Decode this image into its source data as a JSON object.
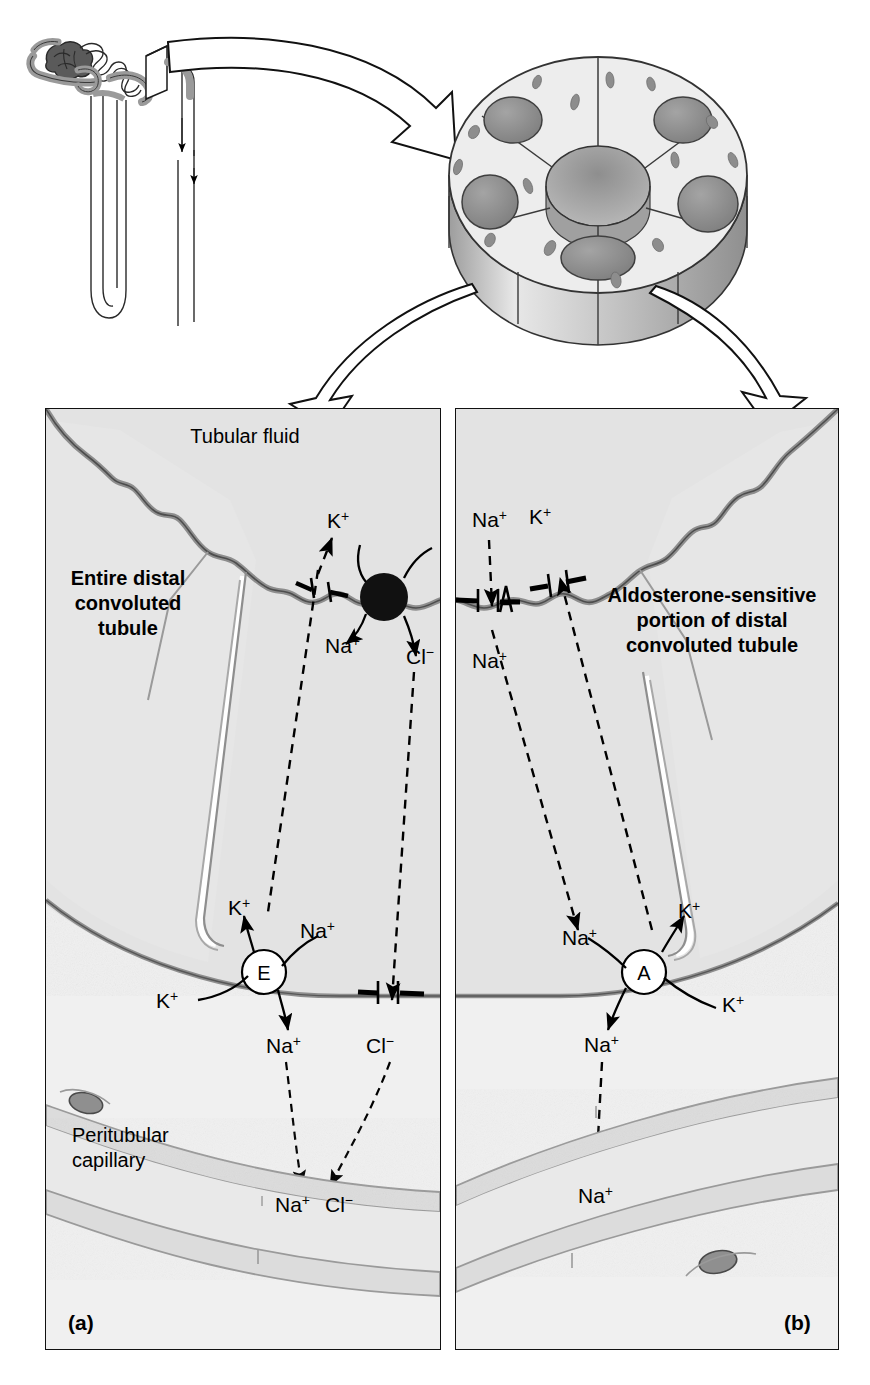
{
  "figure": {
    "type": "anatomical-diagram",
    "overview": {
      "nephron_label": "",
      "tubule_cross_section_cells": 7
    }
  },
  "panels": [
    {
      "tag": "(a)",
      "title": "Entire distal\nconvoluted\ntubule",
      "title_lines": [
        "Entire distal",
        "convoluted",
        "tubule"
      ],
      "lumen_label": "Tubular fluid",
      "capillary_label_lines": [
        "Peritubular",
        "capillary"
      ],
      "pump_letter": "E",
      "apical_ions": [
        "K+",
        "Na+",
        "Cl-"
      ],
      "basal_ions": [
        "K+",
        "Na+",
        "K+",
        "Na+",
        "Cl-"
      ],
      "capillary_ions": [
        "Na+",
        "Cl-"
      ],
      "transporter": "filled-circle-nacl-cotransporter"
    },
    {
      "tag": "(b)",
      "title": "Aldosterone-sensitive\nportion of distal\nconvoluted tubule",
      "title_lines": [
        "Aldosterone-sensitive",
        "portion of distal",
        "convoluted tubule"
      ],
      "pump_letter": "A",
      "apical_ions": [
        "Na+",
        "K+",
        "Na+"
      ],
      "basal_ions": [
        "Na+",
        "K+",
        "Na+",
        "K+"
      ],
      "capillary_ions": [
        "Na+"
      ],
      "transporter": "apical-channels"
    }
  ],
  "ions": {
    "na": "Na",
    "k": "K",
    "cl": "Cl",
    "plus": "+",
    "minus": "−"
  },
  "labels": {
    "tubular_fluid": "Tubular fluid",
    "peritubular_capillary_1": "Peritubular",
    "peritubular_capillary_2": "capillary",
    "entire_1": "Entire distal",
    "entire_2": "convoluted",
    "entire_3": "tubule",
    "aldo_1": "Aldosterone-sensitive",
    "aldo_2": "portion of distal",
    "aldo_3": "convoluted tubule",
    "pump_e": "E",
    "pump_a": "A",
    "tag_a": "(a)",
    "tag_b": "(b)",
    "na": "Na",
    "k": "K",
    "cl": "Cl",
    "sup_plus": "+",
    "sup_minus": "−"
  },
  "colors": {
    "background": "#ffffff",
    "cell_fill": "#e6e6e6",
    "lumen_fill": "#ededed",
    "panel_bg": "#efefef",
    "membrane": "#8a8a8a",
    "outline": "#1a1a1a",
    "nucleus": "#8c8c8c",
    "cell_light": "#f0f0f0",
    "cell_mid": "#c8c8c8",
    "cell_dark": "#9a9a9a",
    "capillary_lumen": "#e4e4e4",
    "capillary_wall": "#cdcdcd"
  }
}
